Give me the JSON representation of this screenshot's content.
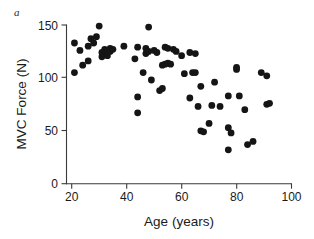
{
  "figure": {
    "panel_label": "a",
    "background_color": "#ffffff",
    "marker_color": "#151515",
    "axis_color": "#3a3a3a"
  },
  "chart_data": {
    "type": "scatter",
    "title": "",
    "subtitle": "",
    "xlabel": "Age (years)",
    "ylabel": "MVC Force (N)",
    "xlim": [
      20,
      100
    ],
    "ylim": [
      0,
      150
    ],
    "xticks": [
      20,
      40,
      60,
      80,
      100
    ],
    "xtick_labels": [
      "20",
      "40",
      "60",
      "80",
      "100"
    ],
    "yticks": [
      0,
      50,
      100,
      150
    ],
    "ytick_labels": [
      "0",
      "50",
      "100",
      "150"
    ],
    "grid": false,
    "legend": null,
    "annotations": [
      {
        "text": "a",
        "position": "top-left",
        "style": "italic"
      }
    ],
    "series": [
      {
        "name": "MVC Force",
        "marker": "circle",
        "marker_color": "#151515",
        "marker_size": 4.6,
        "points": [
          [
            21,
            105
          ],
          [
            21,
            133
          ],
          [
            23,
            126
          ],
          [
            24,
            112
          ],
          [
            26,
            116
          ],
          [
            26,
            130
          ],
          [
            27,
            137
          ],
          [
            28,
            133
          ],
          [
            29,
            139
          ],
          [
            30,
            149
          ],
          [
            31,
            120
          ],
          [
            31,
            124
          ],
          [
            32,
            122
          ],
          [
            32,
            127
          ],
          [
            33,
            121
          ],
          [
            33,
            126
          ],
          [
            34,
            125
          ],
          [
            34,
            128
          ],
          [
            35,
            127
          ],
          [
            39,
            130
          ],
          [
            43,
            118
          ],
          [
            44,
            82
          ],
          [
            44,
            67
          ],
          [
            44,
            129
          ],
          [
            46,
            105
          ],
          [
            47,
            123
          ],
          [
            47,
            128
          ],
          [
            48,
            148
          ],
          [
            48,
            125
          ],
          [
            49,
            98
          ],
          [
            50,
            126
          ],
          [
            51,
            124
          ],
          [
            52,
            88
          ],
          [
            53,
            90
          ],
          [
            53,
            112
          ],
          [
            54,
            113
          ],
          [
            54,
            129
          ],
          [
            55,
            128
          ],
          [
            55,
            114
          ],
          [
            56,
            113
          ],
          [
            57,
            127
          ],
          [
            58,
            125
          ],
          [
            60,
            121
          ],
          [
            61,
            104
          ],
          [
            63,
            124
          ],
          [
            63,
            81
          ],
          [
            64,
            105
          ],
          [
            65,
            123
          ],
          [
            65,
            105
          ],
          [
            66,
            73
          ],
          [
            67,
            92
          ],
          [
            67,
            50
          ],
          [
            68,
            49
          ],
          [
            70,
            57
          ],
          [
            71,
            74
          ],
          [
            72,
            96
          ],
          [
            74,
            73
          ],
          [
            77,
            32
          ],
          [
            77,
            53
          ],
          [
            77,
            83
          ],
          [
            78,
            48
          ],
          [
            80,
            108
          ],
          [
            80,
            110
          ],
          [
            81,
            83
          ],
          [
            83,
            70
          ],
          [
            84,
            37
          ],
          [
            86,
            40
          ],
          [
            89,
            105
          ],
          [
            91,
            102
          ],
          [
            91,
            75
          ],
          [
            92,
            76
          ]
        ]
      }
    ]
  }
}
